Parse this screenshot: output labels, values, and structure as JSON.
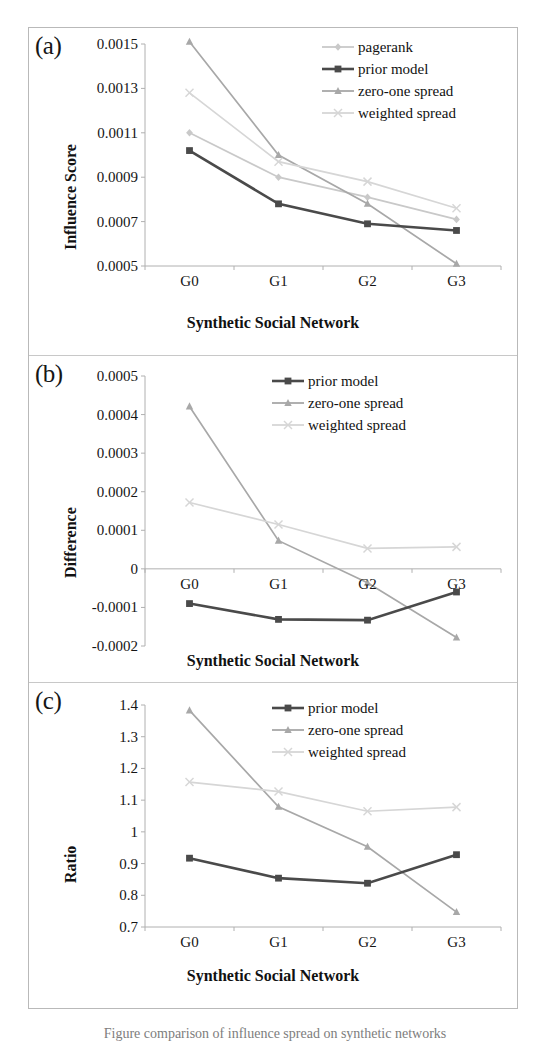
{
  "figure": {
    "caption_partial": "Figure  comparison of influence spread on synthetic networks"
  },
  "panels": [
    {
      "tag": "(a)",
      "ylabel": "Influence Score",
      "xlabel": "Synthetic Social Network"
    },
    {
      "tag": "(b)",
      "ylabel": "Difference",
      "xlabel": "Synthetic Social Network"
    },
    {
      "tag": "(c)",
      "ylabel": "Ratio",
      "xlabel": "Synthetic Social Network"
    }
  ],
  "colors": {
    "pagerank": "#c9c9c9",
    "prior_model": "#4a4a4a",
    "zero_one_spread": "#a8a8a8",
    "weighted_spread": "#d6d6d6",
    "axis": "#b0b0b0",
    "text": "#151515"
  },
  "chart_data": [
    {
      "type": "line",
      "title": "(a)",
      "xlabel": "Synthetic Social Network",
      "ylabel": "Influence Score",
      "categories": [
        "G0",
        "G1",
        "G2",
        "G3"
      ],
      "ylim": [
        0.0005,
        0.0015
      ],
      "yticks": [
        "0.0005",
        "0.0007",
        "0.0009",
        "0.0011",
        "0.0013",
        "0.0015"
      ],
      "ytick_values": [
        0.0005,
        0.0007,
        0.0009,
        0.0011,
        0.0013,
        0.0015
      ],
      "grid": false,
      "legend_position": "top-right",
      "series": [
        {
          "name": "pagerank",
          "marker": "diamond",
          "color": "#c9c9c9",
          "values": [
            0.0011,
            0.0009,
            0.00081,
            0.00071
          ]
        },
        {
          "name": "prior model",
          "marker": "square",
          "color": "#4a4a4a",
          "values": [
            0.00102,
            0.00078,
            0.00069,
            0.00066
          ]
        },
        {
          "name": "zero-one spread",
          "marker": "triangle",
          "color": "#a8a8a8",
          "values": [
            0.00151,
            0.001,
            0.00078,
            0.00051
          ]
        },
        {
          "name": "weighted spread",
          "marker": "cross",
          "color": "#d6d6d6",
          "values": [
            0.00128,
            0.00097,
            0.00088,
            0.00076
          ]
        }
      ]
    },
    {
      "type": "line",
      "title": "(b)",
      "xlabel": "Synthetic Social Network",
      "ylabel": "Difference",
      "categories": [
        "G0",
        "G1",
        "G2",
        "G3"
      ],
      "ylim": [
        -0.0002,
        0.0005
      ],
      "yticks": [
        "-0.0002",
        "-0.0001",
        "0",
        "0.0001",
        "0.0002",
        "0.0003",
        "0.0004",
        "0.0005"
      ],
      "ytick_values": [
        -0.0002,
        -0.0001,
        0,
        0.0001,
        0.0002,
        0.0003,
        0.0004,
        0.0005
      ],
      "grid": false,
      "legend_position": "top-right",
      "series": [
        {
          "name": "prior model",
          "marker": "square",
          "color": "#4a4a4a",
          "values": [
            -9e-05,
            -0.000131,
            -0.000133,
            -6e-05
          ]
        },
        {
          "name": "zero-one spread",
          "marker": "triangle",
          "color": "#a8a8a8",
          "values": [
            0.000421,
            7.3e-05,
            -3.6e-05,
            -0.000178
          ]
        },
        {
          "name": "weighted spread",
          "marker": "cross",
          "color": "#d6d6d6",
          "values": [
            0.000172,
            0.000115,
            5.3e-05,
            5.7e-05
          ]
        }
      ]
    },
    {
      "type": "line",
      "title": "(c)",
      "xlabel": "Synthetic Social Network",
      "ylabel": "Ratio",
      "categories": [
        "G0",
        "G1",
        "G2",
        "G3"
      ],
      "ylim": [
        0.7,
        1.4
      ],
      "yticks": [
        "0.7",
        "0.8",
        "0.9",
        "1",
        "1.1",
        "1.2",
        "1.3",
        "1.4"
      ],
      "ytick_values": [
        0.7,
        0.8,
        0.9,
        1,
        1.1,
        1.2,
        1.3,
        1.4
      ],
      "grid": false,
      "legend_position": "top-right",
      "series": [
        {
          "name": "prior model",
          "marker": "square",
          "color": "#4a4a4a",
          "values": [
            0.917,
            0.854,
            0.838,
            0.928
          ]
        },
        {
          "name": "zero-one spread",
          "marker": "triangle",
          "color": "#a8a8a8",
          "values": [
            1.383,
            1.079,
            0.953,
            0.747
          ]
        },
        {
          "name": "weighted spread",
          "marker": "cross",
          "color": "#d6d6d6",
          "values": [
            1.157,
            1.127,
            1.065,
            1.078
          ]
        }
      ]
    }
  ]
}
